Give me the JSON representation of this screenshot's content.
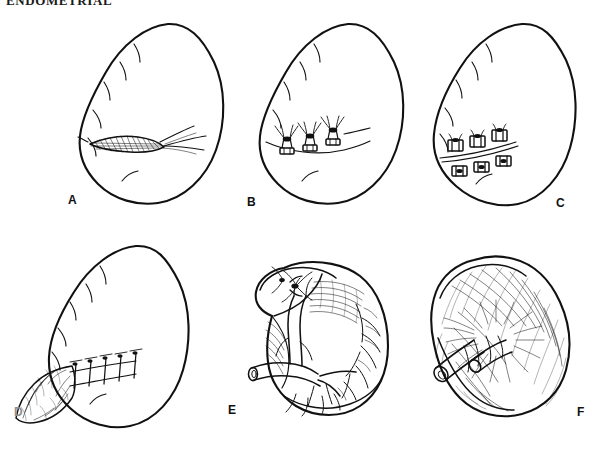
{
  "page": {
    "running_header": "ENDOMETRIAL",
    "width": 604,
    "height": 476,
    "background_color": "#ffffff",
    "ink_color": "#111111"
  },
  "figure": {
    "type": "line-art-medical-illustration",
    "panel_count": 6,
    "layout": "2 rows x 3 columns",
    "panels": [
      {
        "id": "A",
        "label": "A",
        "label_x": 68,
        "label_y": 200,
        "row": 1,
        "column": 1,
        "depicts": "spleen with transverse capsular laceration on the anterior-inferior surface",
        "features": [
          "spleen-outline",
          "capsular-notches",
          "hatched-laceration",
          "bleeding-fissure-lines"
        ]
      },
      {
        "id": "B",
        "label": "B",
        "label_x": 247,
        "label_y": 202,
        "row": 1,
        "column": 2,
        "depicts": "horizontal mattress sutures passed across the laceration over pledgets, untied",
        "features": [
          "spleen-outline",
          "suture-row",
          "pledget",
          "untied-suture-ends"
        ],
        "suture_count": 3
      },
      {
        "id": "C",
        "label": "C",
        "label_x": 556,
        "label_y": 203,
        "row": 1,
        "column": 3,
        "depicts": "pledgeted sutures tied down, approximating the laceration edges",
        "features": [
          "spleen-outline",
          "tied-pledget-pairs",
          "closed-laceration-line"
        ],
        "suture_count": 3
      },
      {
        "id": "D",
        "label": "D",
        "label_x": 14,
        "label_y": 412,
        "label_faint": true,
        "row": 2,
        "column": 1,
        "depicts": "omental patch sutured as a buttress over the splenic laceration",
        "features": [
          "spleen-outline",
          "omentum-flap",
          "interrupted-suture-row"
        ],
        "suture_count": 5
      },
      {
        "id": "E",
        "label": "E",
        "label_x": 228,
        "label_y": 410,
        "row": 2,
        "column": 2,
        "depicts": "splenic hilum with splenic artery and vein branches; segmental vessel ligated",
        "features": [
          "spleen-medial-surface",
          "splenic-artery",
          "splenic-vein",
          "hilar-branches",
          "ligature-tie",
          "cut-vessel-stump"
        ]
      },
      {
        "id": "F",
        "label": "F",
        "label_x": 577,
        "label_y": 412,
        "row": 2,
        "column": 3,
        "depicts": "spleen enclosed in an absorbable mesh wrap, drawn snug around the hilar vessels",
        "features": [
          "spleen-outline",
          "absorbable-mesh-wrap",
          "mesh-gathering-at-hilum",
          "hilar-vessel-stumps"
        ]
      }
    ]
  }
}
